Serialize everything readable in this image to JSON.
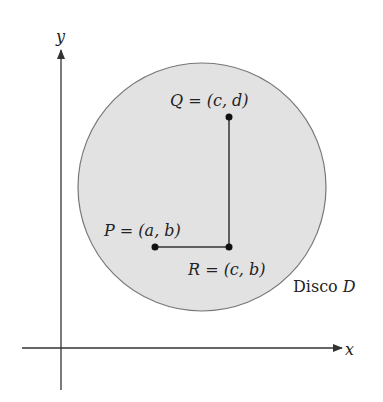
{
  "diagram": {
    "axes": {
      "x_label": "x",
      "y_label": "y"
    },
    "disk": {
      "label_prefix": "Disco ",
      "label_symbol": "D",
      "fill": "#e2e2e2",
      "stroke": "#777777"
    },
    "points": {
      "Q": {
        "label": "Q = (c, d)"
      },
      "P": {
        "label": "P = (a, b)"
      },
      "R": {
        "label": "R = (c, b)"
      }
    }
  }
}
